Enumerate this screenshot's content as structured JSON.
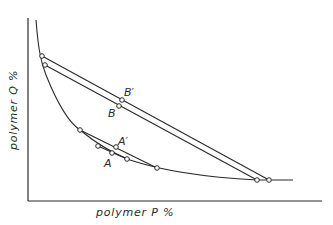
{
  "diagram": {
    "type": "phase-diagram",
    "x_axis_label": "polymer P %",
    "y_axis_label": "polymer Q %",
    "point_labels": {
      "B_prime": "B′",
      "B": "B",
      "A_prime": "A′",
      "A": "A"
    },
    "colors": {
      "line": "#2a2a2a",
      "background": "#ffffff"
    }
  }
}
